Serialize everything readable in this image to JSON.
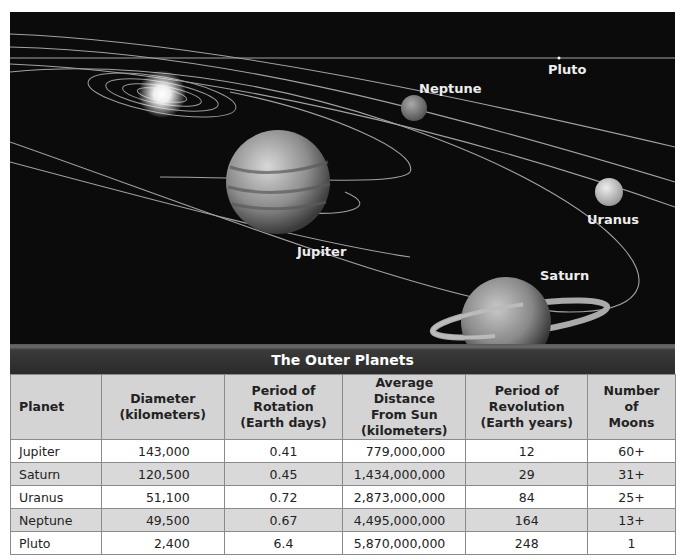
{
  "illustration": {
    "labels": {
      "pluto": "Pluto",
      "neptune": "Neptune",
      "jupiter": "Jupiter",
      "uranus": "Uranus",
      "saturn": "Saturn"
    }
  },
  "table": {
    "title": "The Outer Planets",
    "headers": {
      "planet": "Planet",
      "diameter": [
        "Diameter",
        "(kilometers)"
      ],
      "rotation": [
        "Period of",
        "Rotation",
        "(Earth days)"
      ],
      "distance": [
        "Average Distance",
        "From Sun",
        "(kilometers)"
      ],
      "revolution": [
        "Period of",
        "Revolution",
        "(Earth years)"
      ],
      "moons": [
        "Number of",
        "Moons"
      ]
    },
    "rows": [
      {
        "planet": "Jupiter",
        "diameter": "143,000",
        "rotation": "0.41",
        "distance": "779,000,000",
        "revolution": "12",
        "moons": "60+"
      },
      {
        "planet": "Saturn",
        "diameter": "120,500",
        "rotation": "0.45",
        "distance": "1,434,000,000",
        "revolution": "29",
        "moons": "31+"
      },
      {
        "planet": "Uranus",
        "diameter": "51,100",
        "rotation": "0.72",
        "distance": "2,873,000,000",
        "revolution": "84",
        "moons": "25+"
      },
      {
        "planet": "Neptune",
        "diameter": "49,500",
        "rotation": "0.67",
        "distance": "4,495,000,000",
        "revolution": "164",
        "moons": "13+"
      },
      {
        "planet": "Pluto",
        "diameter": "2,400",
        "rotation": "6.4",
        "distance": "5,870,000,000",
        "revolution": "248",
        "moons": "1"
      }
    ]
  }
}
